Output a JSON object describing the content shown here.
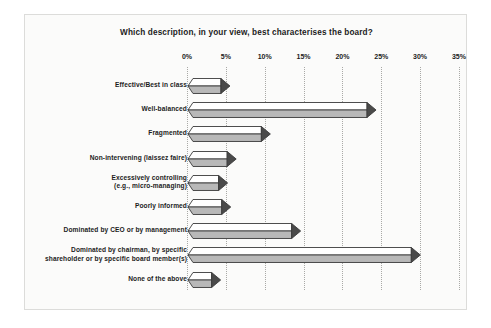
{
  "chart_data": {
    "type": "bar",
    "orientation": "horizontal",
    "title": "Which description, in your view, best characterises the board?",
    "xlabel": "",
    "ylabel": "",
    "xlim": [
      0,
      35
    ],
    "grid": true,
    "legend": null,
    "tick_labels": [
      "0%",
      "5%",
      "10%",
      "15%",
      "20%",
      "25%",
      "30%",
      "35%"
    ],
    "tick_values": [
      0,
      5,
      10,
      15,
      20,
      25,
      30,
      35
    ],
    "categories": [
      "Effective/Best in class",
      "Well-balanced",
      "Fragmented",
      "Non-intervening (laissez faire)",
      "Excessively controlling\n(e.g., micro-managing)",
      "Poorly informed",
      "Dominated by CEO or by management",
      "Dominated by chairman, by specific\nshareholder or by specific board member(s)",
      "None of the above"
    ],
    "values": [
      5.4,
      24.2,
      10.6,
      6.2,
      5.1,
      5.5,
      14.5,
      29.9,
      4.2
    ],
    "series": [
      {
        "name": "Share of respondents",
        "values": [
          5.4,
          24.2,
          10.6,
          6.2,
          5.1,
          5.5,
          14.5,
          29.9,
          4.2
        ]
      }
    ],
    "colors": {
      "bar_top": "#ffffff",
      "bar_bottom": "#b8b8b8",
      "bar_outline": "#3a3a3a",
      "arrow_tip": "#4a4a4a",
      "gridline": "#a9a9a6",
      "background": "#fbfbfa",
      "text": "#1c1c1c"
    }
  }
}
